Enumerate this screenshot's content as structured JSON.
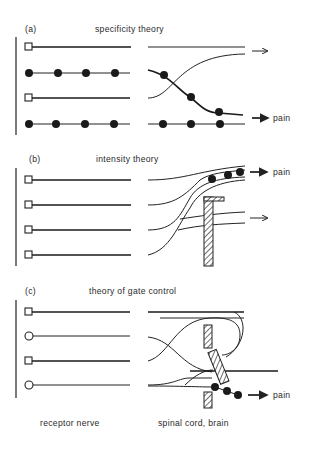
{
  "figure": {
    "panels": [
      {
        "id": "a",
        "label": "(a)",
        "title": "specificity theory",
        "output_labels": [
          "",
          "pain"
        ]
      },
      {
        "id": "b",
        "label": "(b)",
        "title": "intensity theory",
        "output_labels": [
          "pain",
          ""
        ]
      },
      {
        "id": "c",
        "label": "(c)",
        "title": "theory of gate control",
        "output_labels": [
          "pain"
        ]
      }
    ],
    "footer": {
      "left": "receptor nerve",
      "right": "spinal cord, brain"
    },
    "colors": {
      "ink": "#1a1a1a",
      "background": "#ffffff"
    }
  }
}
